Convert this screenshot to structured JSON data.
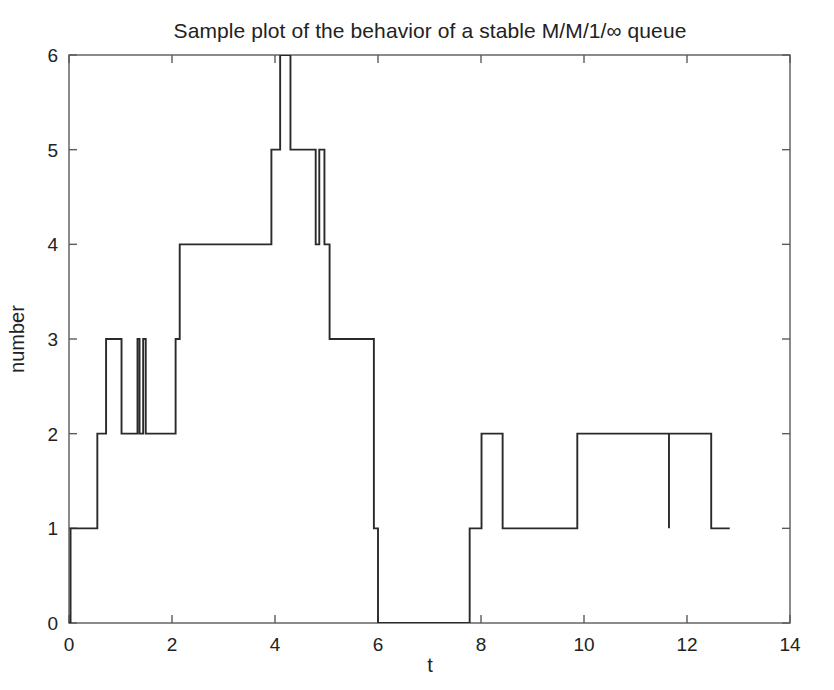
{
  "figure": {
    "title": "Sample plot of the behavior of a stable M/M/1/∞ queue",
    "background_color": "#ffffff",
    "line_color": "#2a2a2a",
    "axis_color": "#5b5b5b",
    "text_color": "#222222"
  },
  "axes": {
    "x": {
      "label": "t",
      "ticks": [
        0,
        2,
        4,
        6,
        8,
        10,
        12,
        14
      ],
      "tick_labels": [
        "0",
        "2",
        "4",
        "6",
        "8",
        "10",
        "12",
        "14"
      ],
      "min": 0,
      "max": 14
    },
    "y": {
      "label": "number",
      "ticks": [
        0,
        1,
        2,
        3,
        4,
        5,
        6
      ],
      "tick_labels": [
        "0",
        "1",
        "2",
        "3",
        "4",
        "5",
        "6"
      ],
      "min": 0,
      "max": 6
    }
  },
  "chart_data": {
    "type": "line",
    "subtype": "step-post",
    "title": "Sample plot of the behavior of a stable M/M/1/∞ queue",
    "xlabel": "t",
    "ylabel": "number",
    "xlim": [
      0,
      14
    ],
    "ylim": [
      0,
      6
    ],
    "grid": false,
    "legend": null,
    "series": [
      {
        "name": "queue length",
        "color": "#2a2a2a",
        "x": [
          0.0,
          0.03,
          0.03,
          0.55,
          0.55,
          0.72,
          0.72,
          1.02,
          1.02,
          1.33,
          1.33,
          1.37,
          1.37,
          1.44,
          1.44,
          1.49,
          1.49,
          2.07,
          2.07,
          2.15,
          2.15,
          3.93,
          3.93,
          4.1,
          4.1,
          4.3,
          4.3,
          4.79,
          4.79,
          4.86,
          4.86,
          4.96,
          4.96,
          5.06,
          5.06,
          5.92,
          5.92,
          6.0,
          6.0,
          7.78,
          7.78,
          8.01,
          8.01,
          8.42,
          8.42,
          9.87,
          9.87,
          11.65,
          11.65,
          11.65,
          11.65,
          12.47,
          12.47,
          12.83
        ],
        "y": [
          0,
          0,
          1,
          1,
          2,
          2,
          3,
          3,
          2,
          2,
          3,
          3,
          2,
          2,
          3,
          3,
          2,
          2,
          3,
          3,
          4,
          4,
          5,
          5,
          6,
          6,
          5,
          5,
          4,
          4,
          5,
          5,
          4,
          4,
          3,
          3,
          1,
          1,
          0,
          0,
          1,
          1,
          2,
          2,
          1,
          1,
          2,
          2,
          1,
          1,
          2,
          2,
          1,
          1
        ],
        "notes": "Right-continuous jump process; peak value 6 is clipped by the top axis at t~4.1-4.3; a zero-width downward spike to 1 appears at t~11.65."
      }
    ],
    "events": [
      {
        "t": 0.03,
        "value": 1,
        "change": "arrival"
      },
      {
        "t": 0.55,
        "value": 2,
        "change": "arrival"
      },
      {
        "t": 0.72,
        "value": 3,
        "change": "arrival"
      },
      {
        "t": 1.02,
        "value": 2,
        "change": "departure"
      },
      {
        "t": 1.33,
        "value": 3,
        "change": "arrival"
      },
      {
        "t": 1.37,
        "value": 2,
        "change": "departure"
      },
      {
        "t": 1.44,
        "value": 3,
        "change": "arrival"
      },
      {
        "t": 1.49,
        "value": 2,
        "change": "departure"
      },
      {
        "t": 2.07,
        "value": 3,
        "change": "arrival"
      },
      {
        "t": 2.15,
        "value": 4,
        "change": "arrival"
      },
      {
        "t": 3.93,
        "value": 5,
        "change": "arrival"
      },
      {
        "t": 4.1,
        "value": 6,
        "change": "arrival"
      },
      {
        "t": 4.3,
        "value": 5,
        "change": "departure"
      },
      {
        "t": 4.79,
        "value": 4,
        "change": "departure"
      },
      {
        "t": 4.86,
        "value": 5,
        "change": "arrival"
      },
      {
        "t": 4.96,
        "value": 4,
        "change": "departure"
      },
      {
        "t": 5.06,
        "value": 3,
        "change": "departure"
      },
      {
        "t": 5.92,
        "value": 1,
        "change": "departure"
      },
      {
        "t": 6.0,
        "value": 0,
        "change": "departure"
      },
      {
        "t": 7.78,
        "value": 1,
        "change": "arrival"
      },
      {
        "t": 8.01,
        "value": 2,
        "change": "arrival"
      },
      {
        "t": 8.42,
        "value": 1,
        "change": "departure"
      },
      {
        "t": 9.87,
        "value": 2,
        "change": "arrival"
      },
      {
        "t": 11.65,
        "value": 1,
        "change": "departure"
      },
      {
        "t": 11.65,
        "value": 2,
        "change": "arrival"
      },
      {
        "t": 12.47,
        "value": 1,
        "change": "departure"
      },
      {
        "t": 12.83,
        "value": 1,
        "change": "end-of-trace"
      }
    ]
  }
}
